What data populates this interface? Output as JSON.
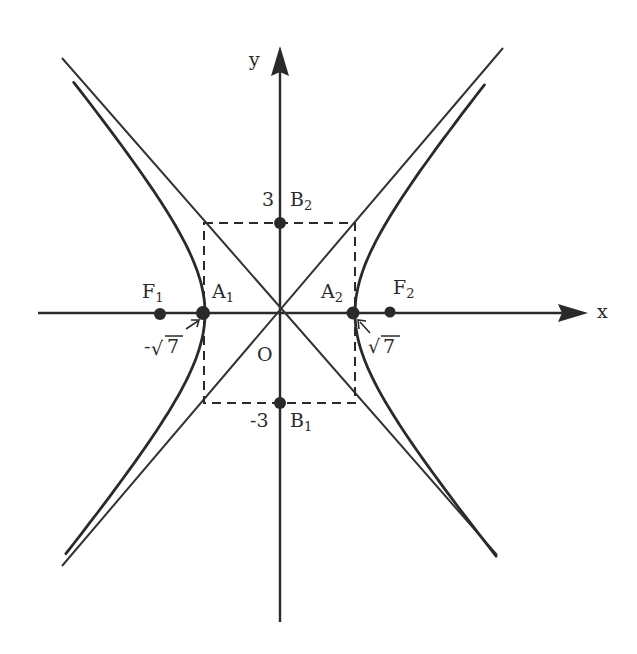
{
  "diagram": {
    "type": "hyperbola",
    "equation_hint": "x^2/7 - y^2/9 = 1",
    "colors": {
      "stroke": "#2a2a2a",
      "background": "#ffffff"
    },
    "origin_px": [
      280,
      313
    ],
    "scale": {
      "a_px": 75,
      "b_px": 90,
      "c_px": 115
    },
    "axes": {
      "x": {
        "label": "x",
        "from": [
          38,
          313
        ],
        "to": [
          585,
          313
        ]
      },
      "y": {
        "label": "y",
        "from": [
          280,
          622
        ],
        "to": [
          280,
          48
        ]
      }
    },
    "labels": {
      "origin": "O",
      "F1": {
        "main": "F",
        "sub": "1"
      },
      "F2": {
        "main": "F",
        "sub": "2"
      },
      "A1": {
        "main": "A",
        "sub": "1"
      },
      "A2": {
        "main": "A",
        "sub": "2"
      },
      "B1": {
        "main": "B",
        "sub": "1"
      },
      "B2": {
        "main": "B",
        "sub": "2"
      },
      "y_tick_pos": "3",
      "y_tick_neg": "-3",
      "x_tick_neg_prefix": "-",
      "x_tick_radical": "√",
      "x_tick_radicand": "7"
    },
    "points": [
      {
        "name": "F1",
        "coords": "(-4, 0)",
        "px": [
          160,
          314
        ]
      },
      {
        "name": "A1",
        "coords": "(-√7, 0)",
        "px": [
          203,
          313
        ]
      },
      {
        "name": "A2",
        "coords": "(√7, 0)",
        "px": [
          353,
          313
        ]
      },
      {
        "name": "F2",
        "coords": "(4, 0)",
        "px": [
          390,
          312
        ]
      },
      {
        "name": "B2",
        "coords": "(0, 3)",
        "px": [
          280,
          223
        ]
      },
      {
        "name": "B1",
        "coords": "(0, -3)",
        "px": [
          280,
          403
        ]
      }
    ],
    "rectangle": {
      "x1": 204,
      "y1": 223,
      "x2": 355,
      "y2": 403,
      "style": "dashed"
    },
    "asymptotes": [
      {
        "from": [
          62,
          58
        ],
        "to": [
          497,
          555
        ]
      },
      {
        "from": [
          503,
          48
        ],
        "to": [
          62,
          566
        ]
      }
    ]
  }
}
